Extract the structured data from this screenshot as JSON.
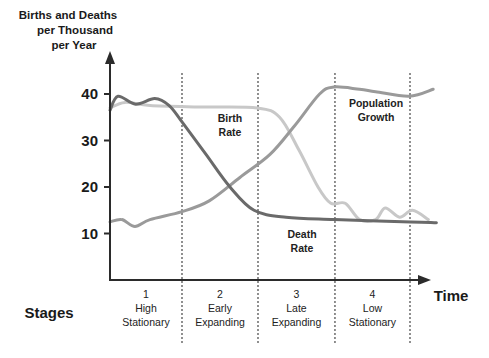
{
  "chart_data": {
    "type": "line",
    "title": "",
    "ylabel_lines": [
      "Births and Deaths",
      "per Thousand",
      "per Year"
    ],
    "xlabel": "Time",
    "stages_label": "Stages",
    "ylim": [
      0,
      45
    ],
    "xlim": [
      0,
      100
    ],
    "yticks": [
      10,
      20,
      30,
      40
    ],
    "grid": false,
    "legend": "none (inline annotations)",
    "stage_boundaries": [
      22.5,
      46.25,
      70.3,
      93.75
    ],
    "stages": [
      {
        "number": "1",
        "line1": "High",
        "line2": "Stationary"
      },
      {
        "number": "2",
        "line1": "Early",
        "line2": "Expanding"
      },
      {
        "number": "3",
        "line1": "Late",
        "line2": "Expanding"
      },
      {
        "number": "4",
        "line1": "Low",
        "line2": "Stationary"
      }
    ],
    "series": [
      {
        "name": "Birth Rate",
        "label_lines": [
          "Birth",
          "Rate"
        ],
        "color": "#c8c8c8",
        "points": [
          [
            0,
            37
          ],
          [
            4.7,
            38.2
          ],
          [
            12.5,
            37.5
          ],
          [
            28,
            37.2
          ],
          [
            46,
            37
          ],
          [
            53,
            35
          ],
          [
            59,
            28
          ],
          [
            65,
            20
          ],
          [
            69,
            16.5
          ],
          [
            73.5,
            16.5
          ],
          [
            78,
            13
          ],
          [
            83,
            13
          ],
          [
            86,
            15.5
          ],
          [
            90.5,
            13.5
          ],
          [
            94.5,
            15
          ],
          [
            99.5,
            13
          ]
        ]
      },
      {
        "name": "Death Rate",
        "label_lines": [
          "Death",
          "Rate"
        ],
        "color": "#6a6a6a",
        "points": [
          [
            0,
            36.5
          ],
          [
            2.5,
            39.5
          ],
          [
            8,
            37.8
          ],
          [
            14,
            39
          ],
          [
            18.5,
            37.5
          ],
          [
            22.5,
            34
          ],
          [
            30,
            27
          ],
          [
            37.5,
            20
          ],
          [
            45,
            15
          ],
          [
            55,
            13.5
          ],
          [
            70,
            13
          ],
          [
            94,
            12.5
          ],
          [
            102,
            12.3
          ]
        ]
      },
      {
        "name": "Population Growth",
        "label_lines": [
          "Population",
          "Growth"
        ],
        "color": "#9a9a9a",
        "points": [
          [
            0,
            12.5
          ],
          [
            3.7,
            13
          ],
          [
            7.8,
            11.5
          ],
          [
            12.5,
            13
          ],
          [
            22.5,
            14.7
          ],
          [
            31,
            17
          ],
          [
            40.5,
            22
          ],
          [
            50,
            27
          ],
          [
            57.5,
            33
          ],
          [
            65.5,
            40
          ],
          [
            70,
            41.5
          ],
          [
            78,
            41
          ],
          [
            83,
            40.5
          ],
          [
            93.5,
            39.5
          ],
          [
            101,
            41
          ]
        ]
      }
    ]
  }
}
